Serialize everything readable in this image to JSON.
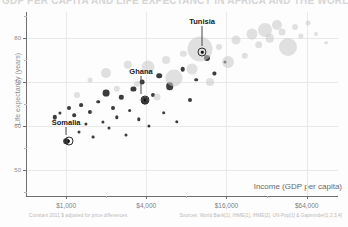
{
  "header": {
    "clipped_headline": "GDP PER CAPITA AND LIFE EXPECTANCY IN AFRICA AND THE WORLD"
  },
  "footnotes": {
    "left": "Constant 2011 $ adjusted for price differences.",
    "right": "Sources: World Bank[1], IHME[1], IHME[2], UN-Pop[1] & Gapminder[1,2,3,4]"
  },
  "chart_data": {
    "type": "scatter",
    "title": "",
    "xlabel": "Income (GDP per capita)",
    "ylabel": "Life expectancy (years)",
    "xscale": "log",
    "xlim": [
      500,
      110000
    ],
    "ylim": [
      44,
      86
    ],
    "grid": true,
    "legend": "none",
    "xticks": [
      {
        "value": 1000,
        "label": "$1,000"
      },
      {
        "value": 4000,
        "label": "$4,000"
      },
      {
        "value": 16000,
        "label": "$16,000"
      },
      {
        "value": 64000,
        "label": "$64,000"
      }
    ],
    "yticks": [
      {
        "value": 80,
        "label": "80"
      },
      {
        "value": 70,
        "label": "70"
      },
      {
        "value": 60,
        "label": "60"
      },
      {
        "value": 50,
        "label": "50"
      }
    ],
    "y_minor_ticks": [
      85,
      75,
      65,
      55,
      45
    ],
    "annotations": [
      {
        "name": "Tunisia",
        "x": 10500,
        "y": 76.8,
        "label_x": 10500,
        "label_y": 84.0
      },
      {
        "name": "Ghana",
        "x": 3900,
        "y": 65.8,
        "label_x": 3650,
        "label_y": 72.5
      },
      {
        "name": "Somalia",
        "x": 1050,
        "y": 56.5,
        "label_x": 1000,
        "label_y": 60.8
      }
    ],
    "series": [
      {
        "name": "Africa",
        "color": "#111111",
        "points": [
          {
            "x": 820,
            "y": 62.0,
            "r": 2.2
          },
          {
            "x": 900,
            "y": 63.0,
            "r": 1.6
          },
          {
            "x": 1000,
            "y": 56.5,
            "r": 2.8
          },
          {
            "x": 1060,
            "y": 64.2,
            "r": 2.0
          },
          {
            "x": 1150,
            "y": 62.5,
            "r": 1.8
          },
          {
            "x": 1250,
            "y": 58.5,
            "r": 1.5
          },
          {
            "x": 1300,
            "y": 64.8,
            "r": 1.9
          },
          {
            "x": 1400,
            "y": 60.5,
            "r": 1.6
          },
          {
            "x": 1500,
            "y": 63.2,
            "r": 2.1
          },
          {
            "x": 1600,
            "y": 57.5,
            "r": 1.4
          },
          {
            "x": 1750,
            "y": 65.5,
            "r": 1.8
          },
          {
            "x": 1900,
            "y": 61.0,
            "r": 1.6
          },
          {
            "x": 2000,
            "y": 67.5,
            "r": 3.4
          },
          {
            "x": 2100,
            "y": 59.5,
            "r": 1.5
          },
          {
            "x": 2250,
            "y": 64.0,
            "r": 2.0
          },
          {
            "x": 2400,
            "y": 62.0,
            "r": 1.7
          },
          {
            "x": 2600,
            "y": 66.5,
            "r": 2.2
          },
          {
            "x": 2800,
            "y": 58.0,
            "r": 1.5
          },
          {
            "x": 3000,
            "y": 63.5,
            "r": 1.9
          },
          {
            "x": 3200,
            "y": 68.5,
            "r": 2.6
          },
          {
            "x": 3500,
            "y": 61.5,
            "r": 1.7
          },
          {
            "x": 3700,
            "y": 70.0,
            "r": 2.4
          },
          {
            "x": 3900,
            "y": 65.8,
            "r": 3.6
          },
          {
            "x": 4200,
            "y": 60.0,
            "r": 1.6
          },
          {
            "x": 4500,
            "y": 67.0,
            "r": 2.0
          },
          {
            "x": 5000,
            "y": 71.5,
            "r": 2.8
          },
          {
            "x": 5400,
            "y": 63.0,
            "r": 1.8
          },
          {
            "x": 6000,
            "y": 69.0,
            "r": 3.8
          },
          {
            "x": 6800,
            "y": 61.0,
            "r": 1.7
          },
          {
            "x": 7500,
            "y": 73.0,
            "r": 2.3
          },
          {
            "x": 8500,
            "y": 66.0,
            "r": 2.0
          },
          {
            "x": 9500,
            "y": 70.5,
            "r": 1.8
          },
          {
            "x": 11500,
            "y": 75.5,
            "r": 3.0
          },
          {
            "x": 13000,
            "y": 72.0,
            "r": 1.6
          },
          {
            "x": 15500,
            "y": 74.5,
            "r": 1.5
          }
        ]
      },
      {
        "name": "World",
        "color": "#c9c9c9",
        "points": [
          {
            "x": 1200,
            "y": 67.0,
            "r": 3.0
          },
          {
            "x": 1500,
            "y": 70.5,
            "r": 2.5
          },
          {
            "x": 2000,
            "y": 72.0,
            "r": 5.0
          },
          {
            "x": 2400,
            "y": 68.5,
            "r": 3.2
          },
          {
            "x": 2900,
            "y": 74.0,
            "r": 4.2
          },
          {
            "x": 3400,
            "y": 69.5,
            "r": 3.0
          },
          {
            "x": 4100,
            "y": 73.5,
            "r": 6.5
          },
          {
            "x": 4800,
            "y": 66.5,
            "r": 3.5
          },
          {
            "x": 5600,
            "y": 75.0,
            "r": 4.0
          },
          {
            "x": 6500,
            "y": 71.0,
            "r": 8.5
          },
          {
            "x": 7600,
            "y": 76.5,
            "r": 3.2
          },
          {
            "x": 8800,
            "y": 73.0,
            "r": 5.5
          },
          {
            "x": 10200,
            "y": 77.5,
            "r": 12.5
          },
          {
            "x": 12000,
            "y": 70.0,
            "r": 4.0
          },
          {
            "x": 14000,
            "y": 78.0,
            "r": 3.0
          },
          {
            "x": 16500,
            "y": 74.5,
            "r": 6.0
          },
          {
            "x": 19000,
            "y": 79.5,
            "r": 4.5
          },
          {
            "x": 22000,
            "y": 76.0,
            "r": 3.2
          },
          {
            "x": 25000,
            "y": 81.0,
            "r": 5.5
          },
          {
            "x": 28000,
            "y": 78.5,
            "r": 3.8
          },
          {
            "x": 31000,
            "y": 82.0,
            "r": 7.0
          },
          {
            "x": 34000,
            "y": 80.0,
            "r": 4.2
          },
          {
            "x": 38000,
            "y": 83.0,
            "r": 5.0
          },
          {
            "x": 42000,
            "y": 81.5,
            "r": 3.5
          },
          {
            "x": 46000,
            "y": 78.0,
            "r": 9.0
          },
          {
            "x": 52000,
            "y": 82.5,
            "r": 3.0
          },
          {
            "x": 58000,
            "y": 80.5,
            "r": 2.6
          },
          {
            "x": 66000,
            "y": 83.5,
            "r": 2.4
          },
          {
            "x": 75000,
            "y": 81.0,
            "r": 2.0
          },
          {
            "x": 90000,
            "y": 79.0,
            "r": 1.8
          }
        ]
      }
    ]
  }
}
